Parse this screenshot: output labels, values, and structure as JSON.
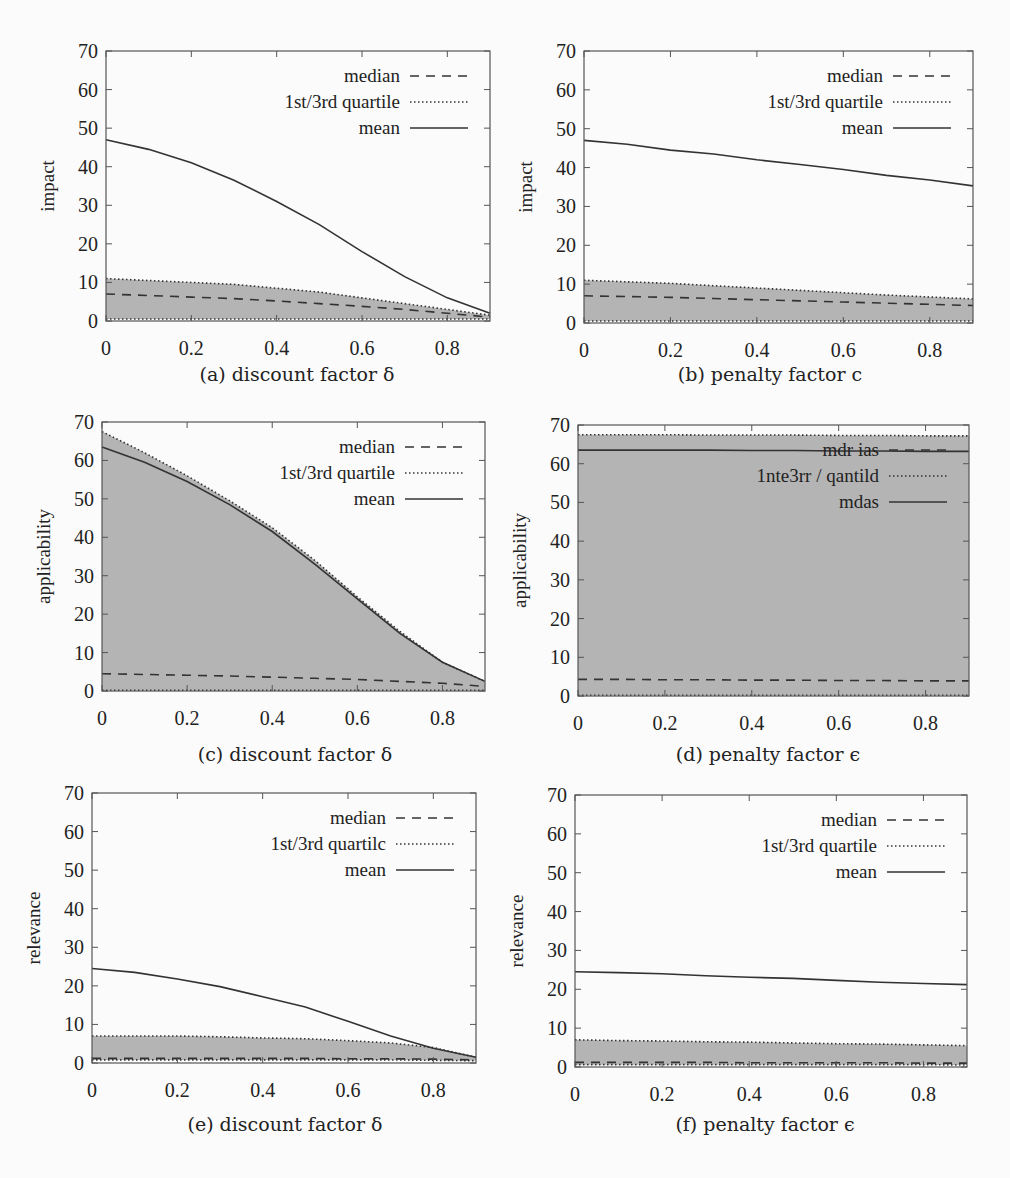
{
  "chart_data": [
    {
      "id": "a",
      "type": "line",
      "caption": "(a) discount factor δ",
      "xlabel": "",
      "ylabel": "impact",
      "xlim": [
        0,
        0.9
      ],
      "ylim": [
        0,
        70
      ],
      "xticks": [
        "0",
        "0.2",
        "0.4",
        "0.6",
        "0.8"
      ],
      "yticks": [
        "0",
        "10",
        "20",
        "30",
        "40",
        "50",
        "60",
        "70"
      ],
      "legend": [
        "median",
        "1st/3rd quartile",
        "mean"
      ],
      "legend_position": "top-right",
      "grid": false,
      "x": [
        0,
        0.1,
        0.2,
        0.3,
        0.4,
        0.5,
        0.6,
        0.7,
        0.8,
        0.9
      ],
      "series": [
        {
          "name": "mean",
          "style": "solid",
          "values": [
            47,
            44.5,
            41,
            36.5,
            31,
            25,
            18,
            11.5,
            6,
            2
          ]
        },
        {
          "name": "3rd quartile",
          "style": "dotted",
          "values": [
            11,
            10.5,
            10,
            9.5,
            8.5,
            7.5,
            6,
            4.5,
            3,
            1.5
          ]
        },
        {
          "name": "median",
          "style": "dashed",
          "values": [
            7,
            6.6,
            6.2,
            5.8,
            5.2,
            4.5,
            3.8,
            3,
            2,
            1
          ]
        },
        {
          "name": "1st quartile",
          "style": "dotted",
          "values": [
            0.5,
            0.5,
            0.5,
            0.5,
            0.5,
            0.5,
            0.5,
            0.5,
            0.5,
            0.5
          ]
        }
      ]
    },
    {
      "id": "b",
      "type": "line",
      "caption": "(b) penalty factor c",
      "xlabel": "",
      "ylabel": "impact",
      "xlim": [
        0,
        0.9
      ],
      "ylim": [
        0,
        70
      ],
      "xticks": [
        "0",
        "0.2",
        "0.4",
        "0.6",
        "0.8"
      ],
      "yticks": [
        "0",
        "10",
        "20",
        "30",
        "40",
        "50",
        "60",
        "70"
      ],
      "legend": [
        "median",
        "1st/3rd quartile",
        "mean"
      ],
      "legend_position": "top-right",
      "grid": false,
      "x": [
        0,
        0.1,
        0.2,
        0.3,
        0.4,
        0.5,
        0.6,
        0.7,
        0.8,
        0.9
      ],
      "series": [
        {
          "name": "mean",
          "style": "solid",
          "values": [
            47,
            46,
            44.5,
            43.5,
            42,
            40.8,
            39.5,
            38,
            36.8,
            35.3
          ]
        },
        {
          "name": "3rd quartile",
          "style": "dotted",
          "values": [
            11,
            10.6,
            10.2,
            9.6,
            9,
            8.4,
            7.8,
            7.2,
            6.7,
            6.2
          ]
        },
        {
          "name": "median",
          "style": "dashed",
          "values": [
            7,
            6.8,
            6.6,
            6.3,
            6,
            5.7,
            5.4,
            5.1,
            4.8,
            4.5
          ]
        },
        {
          "name": "1st quartile",
          "style": "dotted",
          "values": [
            0.5,
            0.5,
            0.5,
            0.5,
            0.5,
            0.5,
            0.5,
            0.5,
            0.5,
            0.5
          ]
        }
      ]
    },
    {
      "id": "c",
      "type": "line",
      "caption": "(c) discount factor δ",
      "xlabel": "",
      "ylabel": "applicability",
      "xlim": [
        0,
        0.9
      ],
      "ylim": [
        0,
        70
      ],
      "xticks": [
        "0",
        "0.2",
        "0.4",
        "0.6",
        "0.8"
      ],
      "yticks": [
        "0",
        "10",
        "20",
        "30",
        "40",
        "50",
        "60",
        "70"
      ],
      "legend": [
        "median",
        "1st/3rd quartile",
        "mean"
      ],
      "legend_position": "top-right",
      "grid": false,
      "x": [
        0,
        0.1,
        0.2,
        0.3,
        0.4,
        0.5,
        0.6,
        0.7,
        0.8,
        0.9
      ],
      "series": [
        {
          "name": "mean",
          "style": "solid",
          "values": [
            63.5,
            59.5,
            54.5,
            48.5,
            41.5,
            33,
            24,
            15,
            7.5,
            2.5
          ]
        },
        {
          "name": "3rd quartile",
          "style": "dotted",
          "values": [
            67.5,
            62,
            56,
            49.5,
            42.5,
            34,
            24.5,
            15.5,
            7.5,
            2.5
          ]
        },
        {
          "name": "median",
          "style": "dashed",
          "values": [
            4.5,
            4.3,
            4.1,
            3.9,
            3.6,
            3.3,
            3,
            2.5,
            2,
            1.2
          ]
        },
        {
          "name": "1st quartile",
          "style": "dotted",
          "values": [
            0.2,
            0.2,
            0.2,
            0.2,
            0.2,
            0.2,
            0.2,
            0.2,
            0.2,
            0.2
          ]
        }
      ]
    },
    {
      "id": "d",
      "type": "line",
      "caption": "(d) penalty factor ϵ",
      "xlabel": "",
      "ylabel": "applicability",
      "xlim": [
        0,
        0.9
      ],
      "ylim": [
        0,
        70
      ],
      "xticks": [
        "0",
        "0.2",
        "0.4",
        "0.6",
        "0.8"
      ],
      "yticks": [
        "0",
        "10",
        "20",
        "30",
        "40",
        "50",
        "60",
        "70"
      ],
      "legend": [
        "mdr ias",
        "1nte3rr / qantild",
        "mdas"
      ],
      "legend_position": "top-right",
      "grid": false,
      "x": [
        0,
        0.1,
        0.2,
        0.3,
        0.4,
        0.5,
        0.6,
        0.7,
        0.8,
        0.9
      ],
      "series": [
        {
          "name": "mean",
          "style": "solid",
          "values": [
            63.5,
            63.5,
            63.5,
            63.5,
            63.4,
            63.4,
            63.3,
            63.3,
            63.2,
            63.2
          ]
        },
        {
          "name": "3rd quartile",
          "style": "dotted",
          "values": [
            67.5,
            67.5,
            67.5,
            67.4,
            67.4,
            67.4,
            67.3,
            67.3,
            67.2,
            67.2
          ]
        },
        {
          "name": "median",
          "style": "dashed",
          "values": [
            4.3,
            4.3,
            4.2,
            4.2,
            4.1,
            4.1,
            4.0,
            4.0,
            3.9,
            3.9
          ]
        },
        {
          "name": "1st quartile",
          "style": "dotted",
          "values": [
            0.2,
            0.2,
            0.2,
            0.2,
            0.2,
            0.2,
            0.2,
            0.2,
            0.2,
            0.2
          ]
        }
      ]
    },
    {
      "id": "e",
      "type": "line",
      "caption": "(e) discount factor δ",
      "xlabel": "",
      "ylabel": "relevance",
      "xlim": [
        0,
        0.9
      ],
      "ylim": [
        0,
        70
      ],
      "xticks": [
        "0",
        "0.2",
        "0.4",
        "0.6",
        "0.8"
      ],
      "yticks": [
        "0",
        "10",
        "20",
        "30",
        "40",
        "50",
        "60",
        "70"
      ],
      "legend": [
        "median",
        "1st/3rd quartilc",
        "mean"
      ],
      "legend_position": "top-right",
      "grid": false,
      "x": [
        0,
        0.1,
        0.2,
        0.3,
        0.4,
        0.5,
        0.6,
        0.7,
        0.8,
        0.9
      ],
      "series": [
        {
          "name": "mean",
          "style": "solid",
          "values": [
            24.5,
            23.5,
            21.8,
            19.8,
            17.2,
            14.5,
            10.8,
            7,
            3.8,
            1.5
          ]
        },
        {
          "name": "3rd quartile",
          "style": "dotted",
          "values": [
            7,
            7,
            7,
            6.8,
            6.5,
            6.3,
            5.8,
            5.2,
            4,
            1.5
          ]
        },
        {
          "name": "median",
          "style": "dashed",
          "values": [
            1.2,
            1.2,
            1.2,
            1.2,
            1.2,
            1.2,
            1.1,
            1.1,
            1,
            0.8
          ]
        },
        {
          "name": "1st quartile",
          "style": "dotted",
          "values": [
            0.8,
            0.8,
            0.8,
            0.8,
            0.8,
            0.8,
            0.8,
            0.8,
            0.7,
            0.6
          ]
        }
      ]
    },
    {
      "id": "f",
      "type": "line",
      "caption": "(f) penalty factor ϵ",
      "xlabel": "",
      "ylabel": "relevance",
      "xlim": [
        0,
        0.9
      ],
      "ylim": [
        0,
        70
      ],
      "xticks": [
        "0",
        "0.2",
        "0.4",
        "0.6",
        "0.8"
      ],
      "yticks": [
        "0",
        "10",
        "20",
        "30",
        "40",
        "50",
        "60",
        "70"
      ],
      "legend": [
        "median",
        "1st/3rd quartile",
        "mean"
      ],
      "legend_position": "top-right",
      "grid": false,
      "x": [
        0,
        0.1,
        0.2,
        0.3,
        0.4,
        0.5,
        0.6,
        0.7,
        0.8,
        0.9
      ],
      "series": [
        {
          "name": "mean",
          "style": "solid",
          "values": [
            24.5,
            24.3,
            24,
            23.5,
            23.1,
            22.8,
            22.3,
            21.8,
            21.5,
            21.2
          ]
        },
        {
          "name": "3rd quartile",
          "style": "dotted",
          "values": [
            7,
            6.8,
            6.7,
            6.5,
            6.4,
            6.2,
            6,
            5.9,
            5.7,
            5.5
          ]
        },
        {
          "name": "median",
          "style": "dashed",
          "values": [
            1.2,
            1.2,
            1.2,
            1.2,
            1.1,
            1.1,
            1.1,
            1.1,
            1,
            1
          ]
        },
        {
          "name": "1st quartile",
          "style": "dotted",
          "values": [
            0.6,
            0.6,
            0.6,
            0.6,
            0.6,
            0.6,
            0.6,
            0.6,
            0.6,
            0.5
          ]
        }
      ]
    }
  ],
  "layout": {
    "fill_color": "#b4b4b4",
    "line_color": "#333333",
    "frame_color": "#555555",
    "panels": [
      {
        "left": 106,
        "top": 51,
        "right": 490,
        "bottom": 321,
        "caption_x": 297,
        "caption_y": 375
      },
      {
        "left": 584,
        "top": 51,
        "right": 973,
        "bottom": 323,
        "caption_x": 770,
        "caption_y": 375
      },
      {
        "left": 102,
        "top": 422,
        "right": 485,
        "bottom": 691,
        "caption_x": 295,
        "caption_y": 755
      },
      {
        "left": 578,
        "top": 425,
        "right": 969,
        "bottom": 696,
        "caption_x": 768,
        "caption_y": 755
      },
      {
        "left": 92,
        "top": 793,
        "right": 476,
        "bottom": 1063,
        "caption_x": 285,
        "caption_y": 1125
      },
      {
        "left": 575,
        "top": 795,
        "right": 967,
        "bottom": 1067,
        "caption_x": 765,
        "caption_y": 1125
      }
    ]
  }
}
